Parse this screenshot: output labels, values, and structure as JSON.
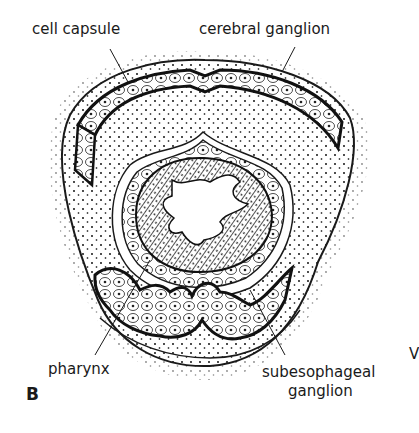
{
  "figure": {
    "panel_letter": "B",
    "labels": {
      "cell_capsule": "cell capsule",
      "cerebral_ganglion": "cerebral ganglion",
      "pharynx": "pharynx",
      "subesophageal_line1": "subesophageal",
      "subesophageal_line2": "ganglion"
    },
    "edge_fragment": "V",
    "colors": {
      "ink": "#1a1a1a",
      "background": "#ffffff"
    }
  }
}
